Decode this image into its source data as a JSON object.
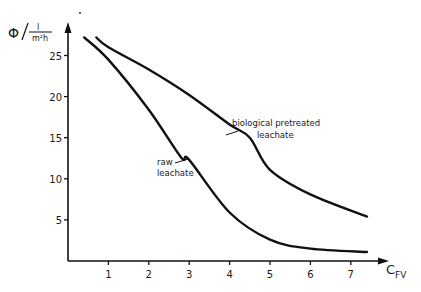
{
  "chart_data": {
    "type": "line",
    "title": "",
    "xlabel": "C_FV",
    "xlabel_main": "C",
    "xlabel_sub": "FV",
    "ylabel": "Φ / l/(m²h)",
    "ylabel_symbol": "Φ",
    "ylabel_unit_num": "l",
    "ylabel_unit_den": "m²h",
    "xlim": [
      0,
      7.8
    ],
    "ylim": [
      0,
      28
    ],
    "xticks": [
      1,
      2,
      3,
      4,
      5,
      6,
      7
    ],
    "yticks": [
      5,
      10,
      15,
      20,
      25
    ],
    "grid": false,
    "legend": "inline annotations",
    "series": [
      {
        "name": "raw leachate",
        "label_lines": [
          "raw",
          "leachate"
        ],
        "x": [
          0.4,
          1.0,
          2.0,
          2.8,
          3.0,
          4.0,
          5.0,
          6.0,
          7.4
        ],
        "y": [
          27.2,
          24.5,
          18.4,
          12.6,
          12.3,
          5.9,
          2.6,
          1.5,
          1.1
        ]
      },
      {
        "name": "biological pretreated leachate",
        "label_lines": [
          "biological  pretreated",
          "leachate"
        ],
        "x": [
          0.7,
          1.0,
          2.0,
          3.0,
          4.0,
          4.5,
          5.0,
          6.0,
          7.4
        ],
        "y": [
          27.2,
          26.0,
          23.3,
          20.2,
          16.6,
          15.0,
          11.1,
          8.1,
          5.4
        ]
      }
    ]
  }
}
